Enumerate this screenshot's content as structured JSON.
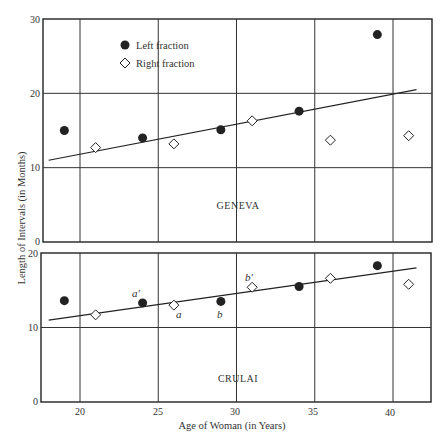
{
  "chart_data": [
    {
      "type": "scatter",
      "panel": "GENEVA",
      "title": "GENEVA",
      "xlabel": "Age of Woman (in Years)",
      "ylabel": "Length of Intervals (in Months)",
      "xlim": [
        17.5,
        42.5
      ],
      "ylim": [
        0,
        30
      ],
      "xticks": [
        20,
        25,
        30,
        35,
        40
      ],
      "yticks": [
        0,
        10,
        20,
        30
      ],
      "grid": true,
      "legend": {
        "position": "upper-left",
        "entries": [
          "Left fraction",
          "Right fraction"
        ]
      },
      "series": [
        {
          "name": "Left fraction",
          "marker": "filled-circle",
          "x": [
            19,
            24,
            29,
            34,
            39
          ],
          "y": [
            15.0,
            14.0,
            15.1,
            17.6,
            27.9
          ]
        },
        {
          "name": "Right fraction",
          "marker": "open-diamond",
          "x": [
            21,
            26,
            31,
            36,
            41
          ],
          "y": [
            12.7,
            13.2,
            16.3,
            13.7,
            14.3
          ]
        }
      ],
      "trend_line": {
        "x": [
          18,
          41.5
        ],
        "y": [
          11.0,
          20.5
        ]
      }
    },
    {
      "type": "scatter",
      "panel": "CRULAI",
      "title": "CRULAI",
      "xlabel": "Age of Woman (in Years)",
      "ylabel": "Length of Intervals (in Months)",
      "xlim": [
        17.5,
        42.5
      ],
      "ylim": [
        0,
        20
      ],
      "xticks": [
        20,
        25,
        30,
        35,
        40
      ],
      "yticks": [
        0,
        10,
        20
      ],
      "grid": true,
      "series": [
        {
          "name": "Left fraction",
          "marker": "filled-circle",
          "x": [
            19,
            24,
            29,
            34,
            39
          ],
          "y": [
            13.6,
            13.3,
            13.5,
            15.5,
            18.3
          ]
        },
        {
          "name": "Right fraction",
          "marker": "open-diamond",
          "x": [
            21,
            26,
            31,
            36,
            41
          ],
          "y": [
            11.7,
            13.0,
            15.4,
            16.6,
            15.8
          ]
        }
      ],
      "trend_line": {
        "x": [
          18,
          41.5
        ],
        "y": [
          11.0,
          18.0
        ]
      },
      "annotations": [
        {
          "text": "a'",
          "x": 24,
          "y": 13.3,
          "position": "above-left"
        },
        {
          "text": "a",
          "x": 26,
          "y": 13.0,
          "position": "below-right"
        },
        {
          "text": "b",
          "x": 29,
          "y": 13.5,
          "position": "below"
        },
        {
          "text": "b'",
          "x": 31,
          "y": 15.4,
          "position": "above"
        }
      ]
    }
  ],
  "labels": {
    "x_axis": "Age of Woman  (in Years)",
    "y_axis": "Length of Intervals  (in Months)",
    "geneva": "GENEVA",
    "crulai": "CRULAI",
    "legend_left": "Left fraction",
    "legend_right": "Right fraction",
    "ann_a_prime": "a′",
    "ann_a": "a",
    "ann_b": "b",
    "ann_b_prime": "b′"
  },
  "ticks": {
    "x": [
      "20",
      "25",
      "30",
      "35",
      "40"
    ],
    "geneva_y": [
      "0",
      "10",
      "20",
      "30"
    ],
    "crulai_y": [
      "0",
      "10",
      "20"
    ]
  },
  "colors": {
    "ink": "#222222",
    "grid": "#333333",
    "background": "#ffffff"
  }
}
